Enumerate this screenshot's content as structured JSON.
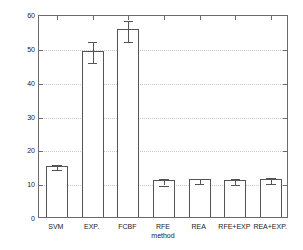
{
  "chart_data": {
    "type": "bar",
    "title": "",
    "xlabel": "method",
    "ylabel_main": "mean squared error × 10",
    "ylabel_exponent": "−3",
    "categories": [
      "SVM",
      "EXP.",
      "FCBF",
      "RFE",
      "REA",
      "RFE+EXP",
      "REA+EXP."
    ],
    "values": [
      15.2,
      49.1,
      55.5,
      10.8,
      11.1,
      10.9,
      11.3
    ],
    "errors_lower": [
      0.7,
      3.1,
      3.2,
      0.9,
      0.8,
      0.9,
      0.9
    ],
    "errors_upper": [
      0.8,
      3.2,
      3.1,
      0.9,
      0.8,
      0.9,
      0.9
    ],
    "ylim": [
      0,
      60
    ],
    "yticks": [
      0,
      10,
      20,
      30,
      40,
      50,
      60
    ],
    "ytick_labels": [
      "0",
      "10",
      "20",
      "30",
      "40",
      "50",
      "60"
    ],
    "grid": true,
    "grid_axis": "y",
    "legend": null,
    "bar_facecolor": "#ffffff",
    "bar_edgecolor": "#555555",
    "errorbar_color": "#555555",
    "axis_color": "#6b6b6b",
    "gridline_color": "#c9c9c9",
    "text_color": "#1a1a1a",
    "background": "#ffffff"
  }
}
